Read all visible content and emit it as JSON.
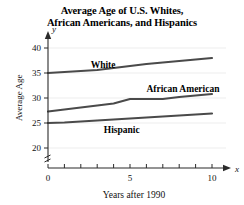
{
  "chart_data": {
    "type": "line",
    "title": "Average Age of U.S. Whites, African Americans, and Hispanics",
    "title_line1": "Average Age of U.S. Whites,",
    "title_line2": "African Americans, and Hispanics",
    "xlabel": "Years after 1990",
    "ylabel": "Average Age",
    "x_axis_var": "x",
    "y_axis_var": "y",
    "xlim": [
      0,
      10
    ],
    "ylim": [
      18,
      41
    ],
    "x_ticks": [
      0,
      1,
      2,
      3,
      4,
      5,
      6,
      7,
      8,
      9,
      10
    ],
    "x_tick_labels": [
      "0",
      "5",
      "10"
    ],
    "x_labeled_values": [
      0,
      5,
      10
    ],
    "y_ticks": [
      20,
      25,
      30,
      35,
      40
    ],
    "y_tick_labels": [
      "20",
      "25",
      "30",
      "35",
      "40"
    ],
    "grid": "horizontal-faint",
    "axis_break": true,
    "legend": "inline-labels",
    "x": [
      0,
      1,
      2,
      3,
      4,
      5,
      6,
      7,
      8,
      9,
      10
    ],
    "series": [
      {
        "name": "White",
        "label": "White",
        "color": "#4a4a4a",
        "values": [
          35.0,
          35.2,
          35.4,
          35.6,
          36.0,
          36.4,
          36.8,
          37.1,
          37.4,
          37.7,
          38.0
        ]
      },
      {
        "name": "African American",
        "label": "African American",
        "color": "#4a4a4a",
        "values": [
          27.3,
          27.7,
          28.1,
          28.5,
          28.9,
          29.8,
          29.8,
          29.8,
          30.2,
          30.5,
          30.8
        ]
      },
      {
        "name": "Hispanic",
        "label": "Hispanic",
        "color": "#4a4a4a",
        "values": [
          25.0,
          25.1,
          25.3,
          25.5,
          25.7,
          25.9,
          26.1,
          26.3,
          26.5,
          26.7,
          26.9
        ]
      }
    ],
    "annotations": [
      {
        "text": "White",
        "near_series": "White"
      },
      {
        "text": "African American",
        "near_series": "African American"
      },
      {
        "text": "Hispanic",
        "near_series": "Hispanic"
      }
    ]
  }
}
